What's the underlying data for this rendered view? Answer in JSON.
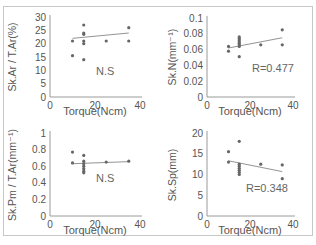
{
  "chart_data": [
    {
      "type": "scatter",
      "panel": "top-left",
      "title": "",
      "xlabel": "Torque (Ncm)",
      "ylabel": "Sk.Ar / T.Ar (%)",
      "xlim": [
        0,
        40
      ],
      "ylim": [
        0,
        30
      ],
      "xticks": [
        "0",
        "20",
        "40"
      ],
      "yticks": [
        "0",
        "5",
        "10",
        "15",
        "20",
        "25",
        "30"
      ],
      "grid": false,
      "annotation": "N.S",
      "points": [
        [
          10,
          21
        ],
        [
          10,
          15.5
        ],
        [
          15,
          27
        ],
        [
          15,
          24
        ],
        [
          15,
          23.5
        ],
        [
          15,
          21
        ],
        [
          15,
          20
        ],
        [
          15,
          14
        ],
        [
          25,
          21
        ],
        [
          35,
          26
        ],
        [
          35,
          21
        ]
      ],
      "trendline": [
        [
          10,
          22
        ],
        [
          35,
          24
        ]
      ]
    },
    {
      "type": "scatter",
      "panel": "top-right",
      "title": "",
      "xlabel": "Torque (Ncm)",
      "ylabel": "Sk.N (mm⁻¹)",
      "xlim": [
        0,
        40
      ],
      "ylim": [
        0,
        0.1
      ],
      "xticks": [
        "0",
        "20",
        "40"
      ],
      "yticks": [
        "0",
        "0.02",
        "0.04",
        "0.06",
        "0.08",
        "0.1"
      ],
      "grid": false,
      "annotation": "R=0.477",
      "points": [
        [
          10,
          0.064
        ],
        [
          10,
          0.058
        ],
        [
          15,
          0.076
        ],
        [
          15,
          0.074
        ],
        [
          15,
          0.072
        ],
        [
          15,
          0.07
        ],
        [
          15,
          0.068
        ],
        [
          15,
          0.066
        ],
        [
          15,
          0.064
        ],
        [
          15,
          0.051
        ],
        [
          25,
          0.066
        ],
        [
          35,
          0.085
        ],
        [
          35,
          0.066
        ]
      ],
      "trendline": [
        [
          10,
          0.062
        ],
        [
          35,
          0.075
        ]
      ]
    },
    {
      "type": "scatter",
      "panel": "bottom-left",
      "title": "",
      "xlabel": "Torque (Ncm)",
      "ylabel": "Sk.Pm / T.Ar (mm⁻¹)",
      "xlim": [
        0,
        40
      ],
      "ylim": [
        0,
        1
      ],
      "xticks": [
        "0",
        "20",
        "40"
      ],
      "yticks": [
        "0",
        "0.2",
        "0.4",
        "0.6",
        "0.8",
        "1"
      ],
      "grid": false,
      "annotation": "N.S",
      "points": [
        [
          10,
          0.77
        ],
        [
          10,
          0.64
        ],
        [
          15,
          0.73
        ],
        [
          15,
          0.66
        ],
        [
          15,
          0.63
        ],
        [
          15,
          0.6
        ],
        [
          15,
          0.57
        ],
        [
          15,
          0.54
        ],
        [
          15,
          0.52
        ],
        [
          25,
          0.65
        ],
        [
          35,
          0.66
        ]
      ],
      "trendline": [
        [
          10,
          0.63
        ],
        [
          35,
          0.655
        ]
      ]
    },
    {
      "type": "scatter",
      "panel": "bottom-right",
      "title": "",
      "xlabel": "Torque (Ncm)",
      "ylabel": "Sk.Sp (mm)",
      "xlim": [
        0,
        40
      ],
      "ylim": [
        0,
        20
      ],
      "xticks": [
        "0",
        "20",
        "40"
      ],
      "yticks": [
        "0",
        "5",
        "10",
        "15",
        "20"
      ],
      "grid": false,
      "annotation": "R=0.348",
      "points": [
        [
          10,
          15.5
        ],
        [
          10,
          13
        ],
        [
          15,
          18
        ],
        [
          15,
          12.5
        ],
        [
          15,
          12
        ],
        [
          15,
          11.5
        ],
        [
          15,
          11
        ],
        [
          15,
          10.5
        ],
        [
          15,
          10
        ],
        [
          25,
          12.5
        ],
        [
          35,
          12.3
        ],
        [
          35,
          9
        ]
      ],
      "trendline": [
        [
          10,
          13.3
        ],
        [
          35,
          10.7
        ]
      ]
    }
  ]
}
